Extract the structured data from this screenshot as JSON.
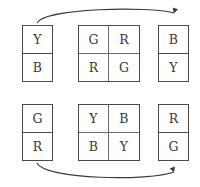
{
  "diagram": {
    "background_color": "#ffffff",
    "stroke_color": "#4a4a4a",
    "text_color": "#3a3a3a",
    "groups": [
      {
        "id": "top-left",
        "layout": "1x2",
        "cells": [
          "Y",
          "B"
        ]
      },
      {
        "id": "top-middle",
        "layout": "2x2",
        "cells": [
          "G",
          "R",
          "R",
          "G"
        ]
      },
      {
        "id": "top-right",
        "layout": "1x2",
        "cells": [
          "B",
          "Y"
        ]
      },
      {
        "id": "bottom-left",
        "layout": "1x2",
        "cells": [
          "G",
          "R"
        ]
      },
      {
        "id": "bottom-middle",
        "layout": "2x2",
        "cells": [
          "Y",
          "B",
          "B",
          "Y"
        ]
      },
      {
        "id": "bottom-right",
        "layout": "1x2",
        "cells": [
          "R",
          "G"
        ]
      }
    ],
    "arrows": [
      {
        "id": "top-arrow",
        "from": "top-left",
        "to": "top-right",
        "direction": "down-into-target"
      },
      {
        "id": "bottom-arrow",
        "from": "bottom-left",
        "to": "bottom-right",
        "direction": "up-into-target"
      }
    ]
  }
}
